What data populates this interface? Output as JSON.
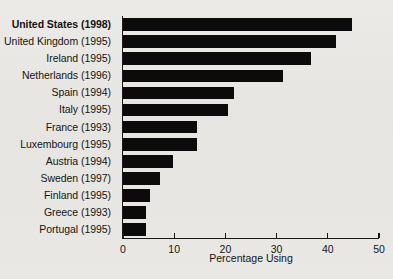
{
  "chart_data": {
    "type": "bar",
    "orientation": "horizontal",
    "title": "",
    "xlabel": "Percentage Using",
    "ylabel": "",
    "xlim": [
      0,
      50
    ],
    "xticks": [
      0,
      10,
      20,
      30,
      40,
      50
    ],
    "xtick_labels": [
      "0",
      "10",
      "20",
      "30",
      "40",
      "50"
    ],
    "grid": false,
    "legend": null,
    "bar_color": "#0b0b0b",
    "categories": [
      "United States (1998)",
      "United Kingdom (1995)",
      "Ireland (1995)",
      "Netherlands (1996)",
      "Spain (1994)",
      "Italy (1995)",
      "France (1993)",
      "Luxembourg (1995)",
      "Austria (1994)",
      "Sweden (1997)",
      "Finland (1995)",
      "Greece (1993)",
      "Portugal (1995)"
    ],
    "values": [
      44.7,
      41.6,
      36.7,
      31.3,
      21.6,
      20.6,
      14.5,
      14.5,
      9.7,
      7.3,
      5.2,
      4.5,
      4.5
    ],
    "emphasized_category": "United States (1998)"
  }
}
